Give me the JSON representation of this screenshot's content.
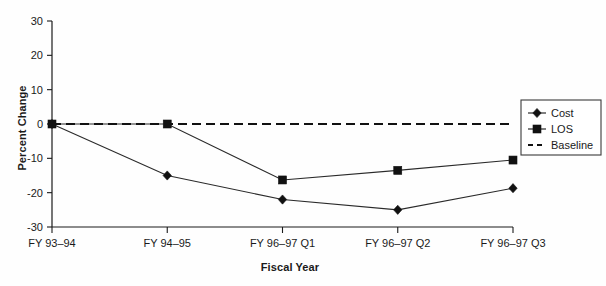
{
  "chart_data": {
    "type": "line",
    "title": "",
    "xlabel": "Fiscal Year",
    "ylabel": "Percent Change",
    "categories": [
      "FY 93–94",
      "FY 94–95",
      "FY 96–97 Q1",
      "FY 96–97 Q2",
      "FY 96–97 Q3"
    ],
    "ylim": [
      -30,
      30
    ],
    "yticks": [
      30,
      20,
      10,
      0,
      -10,
      -20,
      -30
    ],
    "ytick_labels": [
      "30",
      "20",
      "10",
      "0",
      "-10",
      "-20",
      "-30"
    ],
    "grid": false,
    "legend_position": "right",
    "series": [
      {
        "name": "Cost",
        "marker": "diamond",
        "style": "solid",
        "values": [
          0,
          -15,
          -22,
          -25,
          -18.7
        ]
      },
      {
        "name": "LOS",
        "marker": "square",
        "style": "solid",
        "values": [
          0,
          0,
          -16.3,
          -13.5,
          -10.5
        ]
      },
      {
        "name": "Baseline",
        "marker": "none",
        "style": "dashed",
        "values": [
          0,
          0,
          0,
          0,
          0
        ]
      }
    ]
  },
  "legend": {
    "items": [
      {
        "label": "Cost"
      },
      {
        "label": "LOS"
      },
      {
        "label": "Baseline"
      }
    ]
  },
  "colors": {
    "ink": "#1a1a1a",
    "line": "#2a2a2a",
    "marker": "#111111",
    "background": "#fefefe"
  }
}
